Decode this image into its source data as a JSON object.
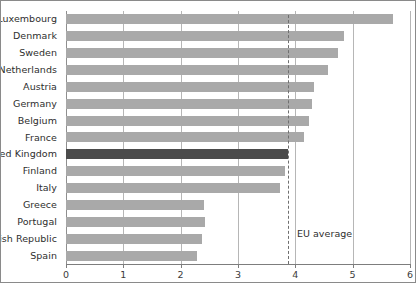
{
  "chart_data": {
    "type": "bar",
    "orientation": "horizontal",
    "title": "",
    "xlabel": "",
    "ylabel": "",
    "xlim": [
      0,
      6
    ],
    "xticks": [
      0,
      1,
      2,
      3,
      4,
      5,
      6
    ],
    "xtick_labels": [
      "0",
      "1",
      "2",
      "3",
      "4",
      "5",
      "6"
    ],
    "grid": "vertical",
    "legend": "none",
    "categories": [
      "Luxembourg",
      "Denmark",
      "Sweden",
      "Netherlands",
      "Austria",
      "Germany",
      "Belgium",
      "France",
      "United Kingdom",
      "Finland",
      "Italy",
      "Greece",
      "Portugal",
      "Irish Republic",
      "Spain"
    ],
    "values": [
      5.7,
      4.85,
      4.75,
      4.57,
      4.33,
      4.29,
      4.24,
      4.15,
      3.87,
      3.82,
      3.73,
      2.41,
      2.43,
      2.37,
      2.29
    ],
    "highlight_category": "United Kingdom",
    "annotations": [
      {
        "name": "eu-average",
        "label": "EU average",
        "value": 3.87,
        "style": "dashed-vertical-line"
      }
    ],
    "colors": {
      "bar": "#a9a9a9",
      "bar_highlight": "#4b4b4b",
      "gridline": "#b6b6b6",
      "axis": "#7d7d7d",
      "text": "#2e2e2e",
      "annotation_line": "#6f6f6f",
      "frame_border": "#8a8a8a",
      "background": "#ffffff"
    }
  }
}
